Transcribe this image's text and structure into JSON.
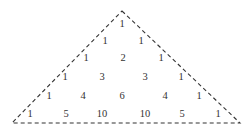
{
  "colors": {
    "background": "#ffffff",
    "line": "#333333",
    "text": "#333333"
  },
  "triangle": {
    "apex": [
      122,
      11
    ],
    "bottom_left": [
      12,
      123
    ],
    "bottom_right": [
      240,
      123
    ],
    "stroke_style": "dashed"
  },
  "rows": [
    {
      "y": 24,
      "values": [
        "1"
      ],
      "x": [
        122
      ]
    },
    {
      "y": 41,
      "values": [
        "1",
        "1"
      ],
      "x": [
        105,
        141
      ]
    },
    {
      "y": 58,
      "values": [
        "1",
        "2",
        "1"
      ],
      "x": [
        86,
        123,
        161
      ]
    },
    {
      "y": 77,
      "values": [
        "1",
        "3",
        "3",
        "1"
      ],
      "x": [
        65,
        102,
        145,
        181
      ]
    },
    {
      "y": 96,
      "values": [
        "1",
        "4",
        "6",
        "4",
        "1"
      ],
      "x": [
        49,
        83,
        122,
        165,
        199
      ]
    },
    {
      "y": 114,
      "values": [
        "1",
        "5",
        "10",
        "10",
        "5",
        "1"
      ],
      "x": [
        30,
        66,
        102,
        145,
        182,
        218
      ]
    }
  ]
}
